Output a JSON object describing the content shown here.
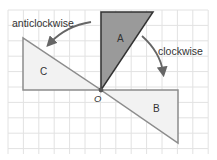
{
  "diagram": {
    "colors": {
      "background": "#ffffff",
      "grid": "#e2e2e2",
      "shape_a_fill": "#9a9a9a",
      "shape_a_stroke": "#333333",
      "shape_light_fill": "#f2f2f2",
      "shape_light_stroke": "#8c8c8c",
      "arrow": "#666666",
      "text": "#333333"
    },
    "grid": {
      "left": 8,
      "top": 10,
      "right": 208,
      "bottom": 154,
      "spacing": 15.4
    },
    "origin": {
      "label": "O",
      "x": 101,
      "y": 90
    },
    "shapes": [
      {
        "id": "A",
        "label": "A",
        "kind": "original",
        "points": "101,12 153,12 101,90",
        "label_x": 117,
        "label_y": 42
      },
      {
        "id": "B",
        "label": "B",
        "kind": "rotated-clockwise-90",
        "points": "101,90 178,90 178,143",
        "label_x": 153,
        "label_y": 112
      },
      {
        "id": "C",
        "label": "C",
        "kind": "rotated-anticlockwise-90",
        "points": "23,38 23,90 101,90",
        "label_x": 40,
        "label_y": 75
      }
    ],
    "arrows": [
      {
        "id": "clockwise",
        "label": "clockwise",
        "label_x": 158,
        "label_y": 55,
        "path": "M142,36 Q160,52 163,72"
      },
      {
        "id": "anticlockwise",
        "label": "anticlockwise",
        "label_x": 12,
        "label_y": 27,
        "path": "M91,22 Q66,26 50,43"
      }
    ]
  }
}
